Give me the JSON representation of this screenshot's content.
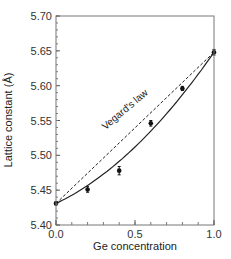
{
  "chart_data": {
    "type": "scatter",
    "title": "",
    "xlabel": "Ge concentration",
    "ylabel": "Lattice constant (Å)",
    "xlim": [
      0.0,
      1.0
    ],
    "ylim": [
      5.4,
      5.7
    ],
    "x_ticks": [
      "0.0",
      "0.5",
      "1.0"
    ],
    "y_ticks": [
      "5.40",
      "5.45",
      "5.50",
      "5.55",
      "5.60",
      "5.65",
      "5.70"
    ],
    "grid": false,
    "series": [
      {
        "name": "Measured",
        "style": "points with error bars",
        "x": [
          0.0,
          0.2,
          0.4,
          0.6,
          0.8,
          1.0
        ],
        "y": [
          5.431,
          5.451,
          5.478,
          5.546,
          5.596,
          5.648
        ],
        "yerr": [
          0.002,
          0.004,
          0.006,
          0.004,
          0.003,
          0.004
        ]
      },
      {
        "name": "Fit",
        "style": "solid curve",
        "x": [
          0.0,
          0.2,
          0.4,
          0.6,
          0.8,
          1.0
        ],
        "y": [
          5.431,
          5.458,
          5.492,
          5.533,
          5.585,
          5.648
        ]
      },
      {
        "name": "Vegard's law",
        "style": "dashed line",
        "x": [
          0.0,
          1.0
        ],
        "y": [
          5.431,
          5.648
        ]
      }
    ],
    "annotations": [
      {
        "text": "Vegard's law",
        "x": 0.5,
        "y": 5.575,
        "rotation": -40
      }
    ]
  }
}
